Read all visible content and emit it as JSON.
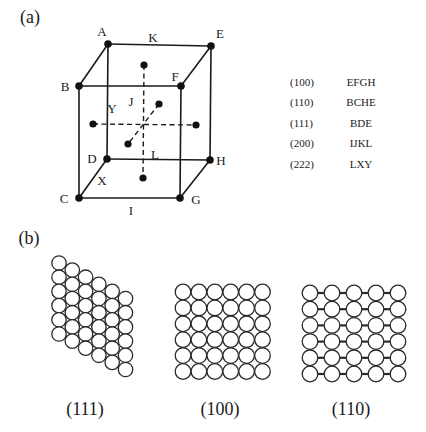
{
  "panel_a": {
    "label": "(a)",
    "cube": {
      "vertices": [
        {
          "name": "A",
          "x": 108,
          "y": 44,
          "lx": 102,
          "ly": 36
        },
        {
          "name": "E",
          "x": 211,
          "y": 46,
          "lx": 220,
          "ly": 38
        },
        {
          "name": "B",
          "x": 79,
          "y": 86,
          "lx": 65,
          "ly": 91
        },
        {
          "name": "F",
          "x": 181,
          "y": 86,
          "lx": 175,
          "ly": 81
        },
        {
          "name": "D",
          "x": 107,
          "y": 159,
          "lx": 92,
          "ly": 163
        },
        {
          "name": "H",
          "x": 210,
          "y": 160,
          "lx": 221,
          "ly": 165
        },
        {
          "name": "C",
          "x": 79,
          "y": 198,
          "lx": 64,
          "ly": 203
        },
        {
          "name": "G",
          "x": 180,
          "y": 198,
          "lx": 196,
          "ly": 204
        }
      ],
      "edges": [
        [
          "A",
          "E"
        ],
        [
          "B",
          "F"
        ],
        [
          "D",
          "H"
        ],
        [
          "C",
          "G"
        ],
        [
          "A",
          "B"
        ],
        [
          "E",
          "F"
        ],
        [
          "D",
          "C"
        ],
        [
          "H",
          "G"
        ],
        [
          "A",
          "D"
        ],
        [
          "E",
          "H"
        ],
        [
          "B",
          "C"
        ],
        [
          "F",
          "G"
        ]
      ],
      "center": {
        "x": 145,
        "y": 124
      },
      "face_centers": [
        {
          "name": "top",
          "x": 144,
          "y": 65
        },
        {
          "name": "bottom",
          "x": 143,
          "y": 178
        },
        {
          "name": "left",
          "x": 93,
          "y": 124
        },
        {
          "name": "right",
          "x": 196,
          "y": 125
        },
        {
          "name": "back",
          "x": 159,
          "y": 104
        },
        {
          "name": "front",
          "x": 128,
          "y": 144
        }
      ],
      "edge_labels": [
        {
          "name": "K",
          "x": 153,
          "y": 42
        },
        {
          "name": "J",
          "x": 131,
          "y": 106
        },
        {
          "name": "Y",
          "x": 112,
          "y": 113
        },
        {
          "name": "L",
          "x": 155,
          "y": 159
        },
        {
          "name": "X",
          "x": 102,
          "y": 185
        },
        {
          "name": "I",
          "x": 131,
          "y": 215
        }
      ]
    },
    "plane_table": {
      "rows": [
        {
          "miller": "(100)",
          "points": "EFGH"
        },
        {
          "miller": "(110)",
          "points": "BCHE"
        },
        {
          "miller": "(111)",
          "points": "BDE"
        },
        {
          "miller": "(200)",
          "points": "IJKL"
        },
        {
          "miller": "(222)",
          "points": "LXY"
        }
      ]
    }
  },
  "panel_b": {
    "label": "(b)",
    "planes": [
      {
        "caption": "(111)",
        "arrangement": "hexagonal-close-packed",
        "columns": 6,
        "rows": 6
      },
      {
        "caption": "(100)",
        "arrangement": "square",
        "columns": 6,
        "rows": 6
      },
      {
        "caption": "(110)",
        "arrangement": "rectangular-with-bonds",
        "columns": 5,
        "rows": 6
      }
    ]
  }
}
